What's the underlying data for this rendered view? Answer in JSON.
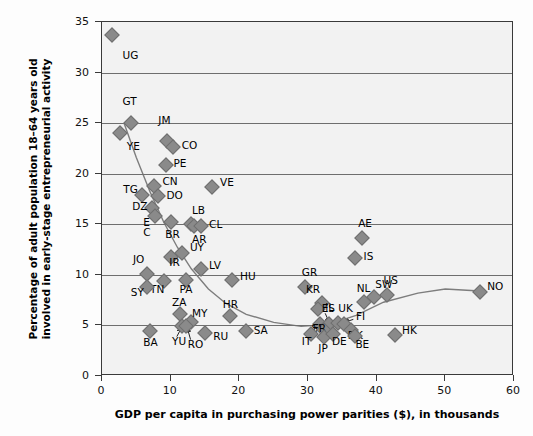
{
  "chart_data": {
    "type": "scatter",
    "title": "",
    "xlabel": "GDP per capita in purchasing power parities ($), in thousands",
    "ylabel": "Percentage of adult population 18–64 years old involved in early-stage entrepreneurial activity",
    "xlim": [
      0,
      60
    ],
    "ylim": [
      0,
      35
    ],
    "xticks": [
      0,
      10,
      20,
      30,
      40,
      50,
      60
    ],
    "yticks": [
      0,
      5,
      10,
      15,
      20,
      25,
      30,
      35
    ],
    "grid": "horizontal",
    "legend": "none",
    "marker_color": "#8a8a8a",
    "trend_color": "#7d7d7d",
    "plot_background": "#f2f2f2",
    "points": [
      {
        "code": "UG",
        "x": 1.5,
        "y": 33.7,
        "lx": 3,
        "ly": 31.6
      },
      {
        "code": "GT",
        "x": 4.2,
        "y": 25.0,
        "lx": 3.0,
        "ly": 27.1
      },
      {
        "code": "YE",
        "x": 2.6,
        "y": 24.0,
        "lx": 3.6,
        "ly": 22.6
      },
      {
        "code": "JM",
        "x": 9.4,
        "y": 23.2,
        "lx": 8.2,
        "ly": 25.2
      },
      {
        "code": "CO",
        "x": 10.4,
        "y": 22.6,
        "lx": 11.6,
        "ly": 22.7
      },
      {
        "code": "PE",
        "x": 9.3,
        "y": 20.9,
        "lx": 10.4,
        "ly": 21.0
      },
      {
        "code": "CN",
        "x": 7.6,
        "y": 18.8,
        "lx": 8.8,
        "ly": 19.2
      },
      {
        "code": "VE",
        "x": 16.0,
        "y": 18.7,
        "lx": 17.2,
        "ly": 19.1
      },
      {
        "code": "TG",
        "x": 5.8,
        "y": 17.9,
        "lx": 3.1,
        "ly": 18.4
      },
      {
        "code": "DO",
        "x": 8.2,
        "y": 17.8,
        "lx": 9.4,
        "ly": 17.8
      },
      {
        "code": "DZ",
        "x": 7.3,
        "y": 16.6,
        "lx": 4.4,
        "ly": 16.7
      },
      {
        "code": "EC",
        "x": 7.7,
        "y": 15.8,
        "lx": 6.0,
        "ly": 15.1
      },
      {
        "code": "BR",
        "x": 10.1,
        "y": 15.2,
        "lx": 9.2,
        "ly": 13.9
      },
      {
        "code": "LB",
        "x": 13.0,
        "y": 15.0,
        "lx": 13.1,
        "ly": 16.3
      },
      {
        "code": "AR",
        "x": 13.4,
        "y": 14.8,
        "lx": 13.1,
        "ly": 13.4
      },
      {
        "code": "CL",
        "x": 14.4,
        "y": 14.8,
        "lx": 15.6,
        "ly": 14.9
      },
      {
        "code": "UY",
        "x": 11.6,
        "y": 12.2,
        "lx": 12.8,
        "ly": 12.7
      },
      {
        "code": "IR",
        "x": 10.0,
        "y": 11.8,
        "lx": 9.8,
        "ly": 11.2
      },
      {
        "code": "LV",
        "x": 14.4,
        "y": 10.6,
        "lx": 15.6,
        "ly": 10.9
      },
      {
        "code": "JO",
        "x": 6.6,
        "y": 10.1,
        "lx": 4.5,
        "ly": 11.5
      },
      {
        "code": "TN",
        "x": 9.0,
        "y": 9.4,
        "lx": 7.0,
        "ly": 8.5
      },
      {
        "code": "PA",
        "x": 12.3,
        "y": 9.5,
        "lx": 11.3,
        "ly": 8.5
      },
      {
        "code": "HU",
        "x": 19.0,
        "y": 9.5,
        "lx": 20.1,
        "ly": 9.8
      },
      {
        "code": "SY",
        "x": 6.5,
        "y": 8.8,
        "lx": 4.2,
        "ly": 8.2
      },
      {
        "code": "GR",
        "x": 29.5,
        "y": 8.8,
        "lx": 29.1,
        "ly": 10.2
      },
      {
        "code": "KR",
        "x": 32.1,
        "y": 7.2,
        "lx": 29.7,
        "ly": 8.5
      },
      {
        "code": "IL",
        "x": 31.4,
        "y": 6.6,
        "lx": 32.5,
        "ly": 6.7
      },
      {
        "code": "ZA",
        "x": 11.4,
        "y": 6.1,
        "lx": 10.2,
        "ly": 7.2
      },
      {
        "code": "HR",
        "x": 18.6,
        "y": 5.9,
        "lx": 17.6,
        "ly": 7.0
      },
      {
        "code": "NL",
        "x": 38.1,
        "y": 7.3,
        "lx": 37.1,
        "ly": 8.6
      },
      {
        "code": "SW",
        "x": 39.6,
        "y": 7.8,
        "lx": 39.8,
        "ly": 9.0
      },
      {
        "code": "US",
        "x": 41.5,
        "y": 8.0,
        "lx": 41.0,
        "ly": 9.4
      },
      {
        "code": "NO",
        "x": 55.0,
        "y": 8.3,
        "lx": 56.1,
        "ly": 8.8
      },
      {
        "code": "AE",
        "x": 37.8,
        "y": 13.6,
        "lx": 37.3,
        "ly": 15.0
      },
      {
        "code": "IS",
        "x": 36.9,
        "y": 11.7,
        "lx": 38.1,
        "ly": 11.8
      },
      {
        "code": "SI",
        "x": 31.8,
        "y": 5.1,
        "lx": 30.5,
        "ly": 4.6
      },
      {
        "code": "ES",
        "x": 33.1,
        "y": 5.1,
        "lx": 32.0,
        "ly": 6.6
      },
      {
        "code": "UK",
        "x": 34.3,
        "y": 5.2,
        "lx": 34.4,
        "ly": 6.6
      },
      {
        "code": "FI",
        "x": 35.2,
        "y": 5.1,
        "lx": 37.0,
        "ly": 5.8
      },
      {
        "code": "FR",
        "x": 32.4,
        "y": 4.5,
        "lx": 30.7,
        "ly": 4.6
      },
      {
        "code": "MY",
        "x": 12.9,
        "y": 5.3,
        "lx": 13.1,
        "ly": 6.1
      },
      {
        "code": "YU",
        "x": 11.6,
        "y": 4.9,
        "lx": 10.2,
        "ly": 3.4
      },
      {
        "code": "RO",
        "x": 12.3,
        "y": 4.9,
        "lx": 12.5,
        "ly": 3.1
      },
      {
        "code": "BA",
        "x": 7.0,
        "y": 4.4,
        "lx": 6.0,
        "ly": 3.3
      },
      {
        "code": "RU",
        "x": 15.0,
        "y": 4.3,
        "lx": 16.2,
        "ly": 3.9
      },
      {
        "code": "SA",
        "x": 20.9,
        "y": 4.4,
        "lx": 22.1,
        "ly": 4.4
      },
      {
        "code": "IT",
        "x": 30.4,
        "y": 4.2,
        "lx": 29.1,
        "ly": 3.4
      },
      {
        "code": "JP",
        "x": 32.3,
        "y": 3.9,
        "lx": 31.5,
        "ly": 2.7
      },
      {
        "code": "DE",
        "x": 33.6,
        "y": 4.2,
        "lx": 33.5,
        "ly": 3.4
      },
      {
        "code": "DK",
        "x": 36.2,
        "y": 4.5,
        "lx": 35.8,
        "ly": 4.0
      },
      {
        "code": "BE",
        "x": 36.8,
        "y": 4.0,
        "lx": 36.9,
        "ly": 3.1
      },
      {
        "code": "HK",
        "x": 42.6,
        "y": 4.1,
        "lx": 43.7,
        "ly": 4.4
      }
    ],
    "trend_curve": [
      {
        "x": 3.2,
        "y": 25.0
      },
      {
        "x": 5.0,
        "y": 21.6
      },
      {
        "x": 7.0,
        "y": 18.2
      },
      {
        "x": 9.0,
        "y": 15.2
      },
      {
        "x": 11.0,
        "y": 12.7
      },
      {
        "x": 13.0,
        "y": 10.6
      },
      {
        "x": 15.5,
        "y": 8.6
      },
      {
        "x": 18.0,
        "y": 7.2
      },
      {
        "x": 21.0,
        "y": 6.1
      },
      {
        "x": 25.0,
        "y": 5.3
      },
      {
        "x": 29.0,
        "y": 4.9
      },
      {
        "x": 33.0,
        "y": 5.1
      },
      {
        "x": 37.0,
        "y": 6.0
      },
      {
        "x": 41.0,
        "y": 7.3
      },
      {
        "x": 46.0,
        "y": 8.2
      },
      {
        "x": 50.0,
        "y": 8.6
      },
      {
        "x": 55.0,
        "y": 8.4
      }
    ],
    "leader_lines": [
      {
        "code": "YU",
        "from_x": 10.9,
        "from_y": 3.9,
        "to_x": 11.6,
        "to_y": 4.8
      },
      {
        "code": "RO",
        "from_x": 12.9,
        "from_y": 3.6,
        "to_x": 12.4,
        "to_y": 4.8
      },
      {
        "code": "ES",
        "from_x": 32.5,
        "from_y": 6.2,
        "to_x": 33.1,
        "to_y": 5.3
      },
      {
        "code": "FI",
        "from_x": 36.6,
        "from_y": 5.6,
        "to_x": 35.3,
        "to_y": 5.3
      }
    ]
  }
}
